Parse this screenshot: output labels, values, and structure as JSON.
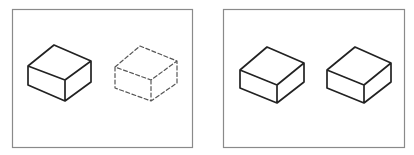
{
  "figure": {
    "colors": {
      "background": "#ffffff",
      "panel_border": "#8a8a8a",
      "solid_edge": "#222222",
      "dashed_edge": "#555555"
    },
    "panels": [
      {
        "id": "left",
        "frame": {
          "x": 12.5,
          "y": 9.5,
          "width": 180,
          "height": 138
        },
        "boxes": [
          {
            "style": "solid",
            "vertices": {
              "top_back": [
                54,
                45
              ],
              "left_top": [
                28,
                66
              ],
              "right_top": [
                91,
                61
              ],
              "front_top": [
                65,
                80
              ],
              "left_bottom": [
                28,
                85
              ],
              "front_bottom": [
                65,
                101
              ],
              "right_bottom": [
                91,
                82
              ]
            }
          },
          {
            "style": "dashed",
            "vertices": {
              "top_back": [
                140,
                46
              ],
              "left_top": [
                115,
                67
              ],
              "right_top": [
                177,
                61
              ],
              "front_top": [
                151,
                80
              ],
              "left_bottom": [
                115,
                88
              ],
              "front_bottom": [
                151,
                101
              ],
              "right_bottom": [
                177,
                83
              ]
            }
          }
        ]
      },
      {
        "id": "right",
        "frame": {
          "x": 223.5,
          "y": 9.5,
          "width": 181,
          "height": 138
        },
        "boxes": [
          {
            "style": "solid",
            "vertices": {
              "top_back": [
                267,
                47
              ],
              "left_top": [
                240,
                70
              ],
              "right_top": [
                304,
                63
              ],
              "front_top": [
                277,
                85
              ],
              "left_bottom": [
                240,
                88
              ],
              "front_bottom": [
                277,
                103
              ],
              "right_bottom": [
                304,
                82
              ]
            }
          },
          {
            "style": "solid",
            "vertices": {
              "top_back": [
                355,
                47
              ],
              "left_top": [
                327,
                70
              ],
              "right_top": [
                391,
                63
              ],
              "front_top": [
                364,
                85
              ],
              "left_bottom": [
                327,
                88
              ],
              "front_bottom": [
                364,
                103
              ],
              "right_bottom": [
                391,
                82
              ]
            }
          }
        ]
      }
    ],
    "caption": {
      "left": "· · · ·  · · ·  · · · · ·  · · · ·  · · ·",
      "right": "· ·  · · · ·  · · · · ·  · · · ·  · · ·"
    }
  }
}
